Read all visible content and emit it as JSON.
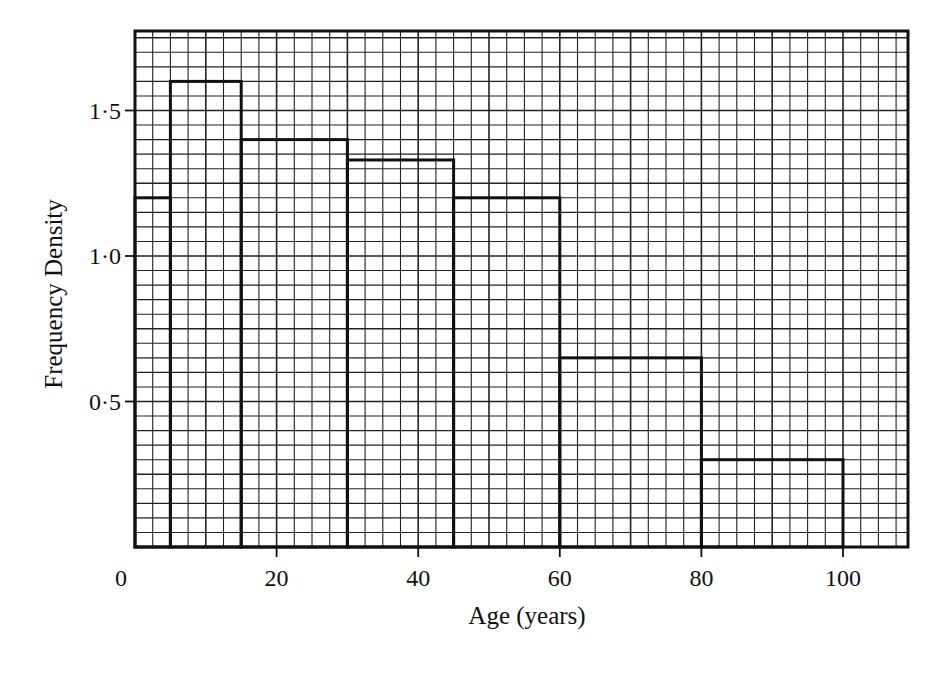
{
  "chart_data": {
    "type": "bar",
    "subtype": "histogram",
    "title": "",
    "xlabel": "Age (years)",
    "ylabel": "Frequency Density",
    "xlim": [
      0,
      110
    ],
    "ylim": [
      0,
      1.75
    ],
    "x_ticks": [
      0,
      20,
      40,
      60,
      80,
      100
    ],
    "x_tick_labels": [
      "0",
      "20",
      "40",
      "60",
      "80",
      "100"
    ],
    "y_ticks": [
      0.5,
      1.0,
      1.5
    ],
    "y_tick_labels": [
      "0·5",
      "1·0",
      "1·5"
    ],
    "grid": true,
    "legend": null,
    "bins": [
      {
        "from": 0,
        "to": 5,
        "density": 1.2
      },
      {
        "from": 5,
        "to": 15,
        "density": 1.6
      },
      {
        "from": 15,
        "to": 30,
        "density": 1.4
      },
      {
        "from": 30,
        "to": 45,
        "density": 1.33
      },
      {
        "from": 45,
        "to": 60,
        "density": 1.2
      },
      {
        "from": 60,
        "to": 80,
        "density": 0.65
      },
      {
        "from": 80,
        "to": 100,
        "density": 0.3
      }
    ],
    "categories": [
      "0-5",
      "5-15",
      "15-30",
      "30-45",
      "45-60",
      "60-80",
      "80-100"
    ],
    "values": [
      1.2,
      1.6,
      1.4,
      1.33,
      1.2,
      0.65,
      0.3
    ]
  },
  "colors": {
    "ink": "#111111",
    "grid": "#222222",
    "background": "#ffffff"
  }
}
